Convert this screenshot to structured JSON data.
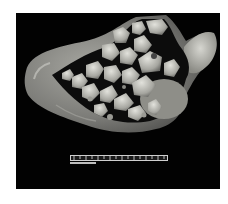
{
  "image": {
    "subject": "gross pathology specimen: opened gallbladder filled with numerous faceted gallstones",
    "background_color": "#020202",
    "page_background": "#ffffff",
    "specimen_wall_color": "#8a8a86",
    "stone_color": "#b8b8b2",
    "ruler": {
      "present": true,
      "color": "#d8d8d8"
    }
  }
}
